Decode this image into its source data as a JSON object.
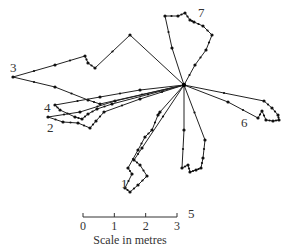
{
  "diagram": {
    "type": "foraging-paths",
    "origin": [
      184,
      85
    ],
    "paths": [
      {
        "label": "1",
        "label_pos": [
          121,
          188
        ],
        "points": [
          [
            184,
            85
          ],
          [
            160,
            112
          ],
          [
            158,
            115
          ],
          [
            152,
            130
          ],
          [
            145,
            137
          ],
          [
            138,
            150
          ],
          [
            128,
            168
          ],
          [
            132,
            174
          ],
          [
            125,
            188
          ],
          [
            130,
            192
          ],
          [
            138,
            185
          ],
          [
            147,
            176
          ],
          [
            140,
            165
          ],
          [
            134,
            160
          ],
          [
            142,
            148
          ],
          [
            184,
            85
          ]
        ]
      },
      {
        "label": "2",
        "label_pos": [
          47,
          132
        ],
        "points": [
          [
            184,
            85
          ],
          [
            115,
            101
          ],
          [
            80,
            112
          ],
          [
            48,
            117
          ],
          [
            63,
            122
          ],
          [
            78,
            123
          ],
          [
            90,
            128
          ],
          [
            96,
            121
          ],
          [
            104,
            112
          ],
          [
            140,
            99
          ],
          [
            184,
            85
          ]
        ]
      },
      {
        "label": "3",
        "label_pos": [
          10,
          72
        ],
        "points": [
          [
            184,
            85
          ],
          [
            130,
            35
          ],
          [
            95,
            68
          ],
          [
            88,
            63
          ],
          [
            85,
            56
          ],
          [
            55,
            65
          ],
          [
            13,
            77
          ],
          [
            55,
            87
          ],
          [
            88,
            100
          ],
          [
            100,
            104
          ],
          [
            184,
            85
          ]
        ]
      },
      {
        "label": "4",
        "label_pos": [
          44,
          112
        ],
        "points": [
          [
            184,
            85
          ],
          [
            140,
            90
          ],
          [
            100,
            97
          ],
          [
            55,
            105
          ],
          [
            60,
            110
          ],
          [
            75,
            117
          ],
          [
            82,
            119
          ],
          [
            88,
            114
          ],
          [
            97,
            109
          ],
          [
            112,
            104
          ],
          [
            184,
            85
          ]
        ]
      },
      {
        "label": "5",
        "label_pos": [
          188,
          218
        ],
        "points": [
          [
            184,
            85
          ],
          [
            184,
            130
          ],
          [
            182,
            168
          ],
          [
            188,
            165
          ],
          [
            190,
            172
          ],
          [
            196,
            170
          ],
          [
            201,
            168
          ],
          [
            203,
            158
          ],
          [
            205,
            140
          ],
          [
            184,
            85
          ]
        ]
      },
      {
        "label": "6",
        "label_pos": [
          241,
          127
        ],
        "points": [
          [
            184,
            85
          ],
          [
            228,
            102
          ],
          [
            258,
            118
          ],
          [
            262,
            111
          ],
          [
            266,
            120
          ],
          [
            273,
            121
          ],
          [
            279,
            120
          ],
          [
            278,
            115
          ],
          [
            272,
            108
          ],
          [
            264,
            101
          ],
          [
            184,
            85
          ]
        ]
      },
      {
        "label": "7",
        "label_pos": [
          198,
          17
        ],
        "points": [
          [
            184,
            85
          ],
          [
            172,
            48
          ],
          [
            165,
            16
          ],
          [
            178,
            16
          ],
          [
            185,
            13
          ],
          [
            190,
            20
          ],
          [
            194,
            22
          ],
          [
            203,
            26
          ],
          [
            212,
            35
          ],
          [
            206,
            50
          ],
          [
            195,
            65
          ],
          [
            184,
            85
          ]
        ]
      }
    ],
    "scale_bar": {
      "title": "Scale in metres",
      "ticks": [
        "0",
        "1",
        "2",
        "3"
      ],
      "unit": "metres",
      "x_start": 83,
      "x_end": 177,
      "y": 217
    },
    "line_color": "#222222",
    "dot_color": "#111111"
  }
}
